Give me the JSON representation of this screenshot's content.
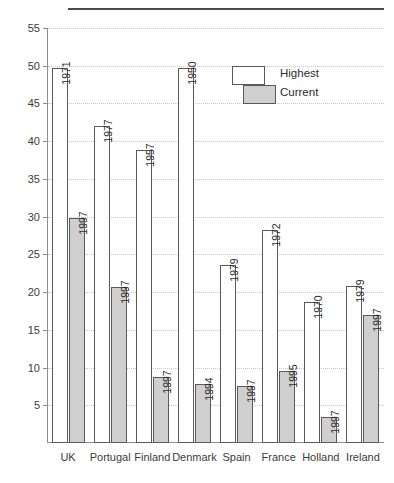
{
  "chart_data": {
    "type": "bar",
    "title": "",
    "subtitle": "",
    "xlabel": "",
    "ylabel": "",
    "ylim": [
      0,
      55
    ],
    "yticks": [
      5,
      10,
      15,
      20,
      25,
      30,
      35,
      40,
      45,
      50,
      55
    ],
    "grid": true,
    "legend_position": "inside-top-right",
    "categories": [
      "UK",
      "Portugal",
      "Finland",
      "Denmark",
      "Spain",
      "France",
      "Holland",
      "Ireland"
    ],
    "series": [
      {
        "name": "Highest",
        "color": "#ffffff",
        "values": [
          49.7,
          42.0,
          38.8,
          49.7,
          23.6,
          28.2,
          18.7,
          20.8
        ],
        "point_labels": [
          "1971",
          "1977",
          "1957",
          "1950",
          "1979",
          "1972",
          "1970",
          "1979"
        ]
      },
      {
        "name": "Current",
        "color": "#cfcfcf",
        "values": [
          29.8,
          20.7,
          8.7,
          7.8,
          7.5,
          9.5,
          3.5,
          16.9
        ],
        "point_labels": [
          "1997",
          "1997",
          "1997",
          "1994",
          "1997",
          "1995",
          "1997",
          "1997"
        ]
      }
    ]
  },
  "legend": {
    "items": [
      {
        "label": "Highest",
        "swatch": "white-box"
      },
      {
        "label": "Current",
        "swatch": "gray-box"
      }
    ]
  },
  "colors": {
    "highest_fill": "#ffffff",
    "current_fill": "#cfcfcf",
    "bar_stroke": "#5a5a5a",
    "axis": "#8d8d8d",
    "grid": "#c9c9c9",
    "text": "#3c3c3c",
    "top_rule": "#4a4a4a"
  }
}
